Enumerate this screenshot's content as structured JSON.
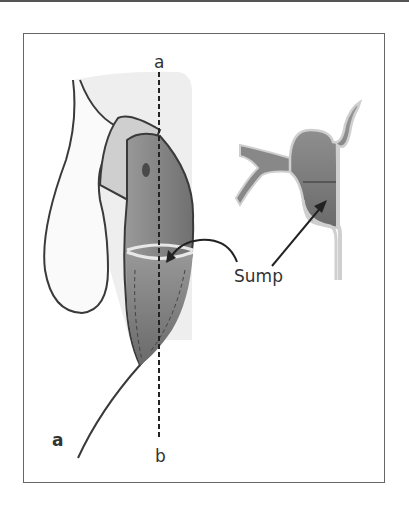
{
  "figure": {
    "panel_label": "a",
    "axis_top_label": "a",
    "axis_bottom_label": "b",
    "annotation": "Sump",
    "colors": {
      "outline": "#3a3a3a",
      "light_region": "#ececec",
      "pouch_fill": "#8c8c8c",
      "pouch_dark": "#6f6f6f",
      "wall_light": "#cfcfcf"
    }
  }
}
